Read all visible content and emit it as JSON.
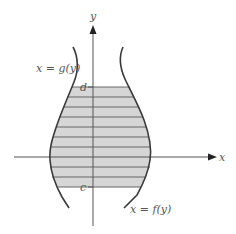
{
  "diagram": {
    "type": "region-between-curves-horizontal-slices",
    "axes": {
      "x_label": "x",
      "y_label": "y"
    },
    "curves": {
      "left": {
        "label": "x = g(y)"
      },
      "right": {
        "label": "x = f(y)"
      }
    },
    "bounds": {
      "lower_label": "c",
      "upper_label": "d"
    },
    "slice_count": 10,
    "colors": {
      "shade": "#d6d6d6",
      "curve": "#3a3a3a",
      "axis": "#555555",
      "slice_line": "#666666",
      "label": "#555555"
    }
  }
}
